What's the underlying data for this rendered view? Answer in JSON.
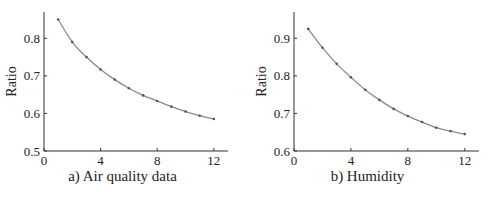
{
  "chart_data": [
    {
      "type": "line",
      "title": "a) Air quality data",
      "xlabel": "Time interval (hours)",
      "ylabel": "Ratio",
      "xlim": [
        0,
        13
      ],
      "ylim": [
        0.5,
        0.87
      ],
      "xticks": [
        0,
        4,
        8,
        12
      ],
      "yticks": [
        0.5,
        0.6,
        0.7,
        0.8
      ],
      "grid": false,
      "x": [
        1,
        2,
        3,
        4,
        5,
        6,
        7,
        8,
        9,
        10,
        11,
        12
      ],
      "series": [
        {
          "name": "Air quality",
          "values": [
            0.85,
            0.79,
            0.75,
            0.717,
            0.69,
            0.667,
            0.648,
            0.633,
            0.618,
            0.605,
            0.594,
            0.585
          ]
        }
      ]
    },
    {
      "type": "line",
      "title": "b) Humidity",
      "xlabel": "Time interval (hours)",
      "ylabel": "Ratio",
      "xlim": [
        0,
        13
      ],
      "ylim": [
        0.6,
        0.97
      ],
      "xticks": [
        0,
        4,
        8,
        12
      ],
      "yticks": [
        0.6,
        0.7,
        0.8,
        0.9
      ],
      "grid": false,
      "x": [
        1,
        2,
        3,
        4,
        5,
        6,
        7,
        8,
        9,
        10,
        11,
        12
      ],
      "series": [
        {
          "name": "Humidity",
          "values": [
            0.925,
            0.875,
            0.832,
            0.796,
            0.763,
            0.736,
            0.712,
            0.693,
            0.677,
            0.662,
            0.653,
            0.645
          ]
        }
      ]
    }
  ],
  "panels": {
    "a": {
      "caption": "a) Air quality data",
      "xlabel": "Time interval (hours)",
      "ylabel": "Ratio"
    },
    "b": {
      "caption": "b) Humidity",
      "xlabel": "Time interval (hours)",
      "ylabel": "Ratio"
    }
  },
  "colors": {
    "line": "#8a8a8a",
    "marker": "#555555",
    "axis": "#333333"
  }
}
